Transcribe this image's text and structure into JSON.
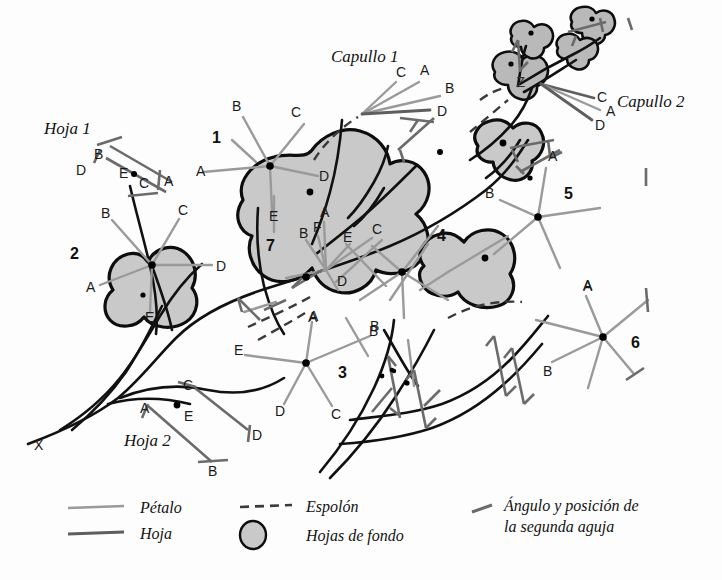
{
  "figure": {
    "title_labels": {
      "capullo1": "Capullo 1",
      "capullo2": "Capullo 2",
      "hoja1": "Hoja 1",
      "hoja2": "Hoja 2",
      "origin_marker": "X",
      "z_marker": "Z"
    },
    "background_color": "#fdfdfd",
    "colors": {
      "petal_line": "#9a9a9a",
      "leaf_line": "#5e5e5e",
      "outline": "#0d0d0d",
      "blob_fill": "#c9c9c9",
      "spur_dash": "#3a3a3a",
      "needle": "#6b6b6b"
    }
  },
  "clusters": [
    {
      "id": "1",
      "number": "1",
      "number_pos": [
        216,
        137
      ],
      "center": [
        270,
        166
      ],
      "petals": [
        {
          "label": "B",
          "label_pos": [
            235,
            107
          ],
          "tip": [
            245,
            119
          ]
        },
        {
          "label": "C",
          "label_pos": [
            294,
            113
          ],
          "tip": [
            305,
            124
          ]
        },
        {
          "label": "A",
          "label_pos": [
            200,
            171
          ],
          "tip": [
            212,
            170
          ]
        },
        {
          "label": "D",
          "label_pos": [
            322,
            176
          ],
          "tip": [
            312,
            174
          ]
        },
        {
          "label": "E",
          "label_pos": [
            273,
            216
          ],
          "tip": [
            272,
            205
          ]
        }
      ]
    },
    {
      "id": "2",
      "number": "2",
      "number_pos": [
        74,
        253
      ],
      "center": [
        152,
        265
      ],
      "petals": [
        {
          "label": "B",
          "label_pos": [
            105,
            213
          ],
          "tip": [
            116,
            223
          ]
        },
        {
          "label": "C",
          "label_pos": [
            181,
            210
          ],
          "tip": [
            176,
            222
          ]
        },
        {
          "label": "A",
          "label_pos": [
            90,
            287
          ],
          "tip": [
            104,
            284
          ]
        },
        {
          "label": "D",
          "label_pos": [
            220,
            266
          ],
          "tip": [
            208,
            265
          ]
        },
        {
          "label": "E",
          "label_pos": [
            149,
            316
          ],
          "tip": [
            150,
            305
          ]
        }
      ]
    },
    {
      "id": "3",
      "number": "3",
      "number_pos": [
        341,
        372
      ],
      "center": [
        306,
        363
      ],
      "petals": [
        {
          "label": "E",
          "label_pos": [
            237,
            350
          ],
          "tip": [
            250,
            356
          ]
        },
        {
          "label": "A",
          "label_pos": [
            313,
            317
          ],
          "tip": [
            312,
            330
          ]
        },
        {
          "label": "B",
          "label_pos": [
            372,
            331
          ],
          "tip": [
            366,
            342
          ]
        },
        {
          "label": "C",
          "label_pos": [
            334,
            414
          ],
          "tip": [
            330,
            400
          ]
        },
        {
          "label": "D",
          "label_pos": [
            278,
            411
          ],
          "tip": [
            287,
            398
          ]
        }
      ]
    },
    {
      "id": "4",
      "number": "4",
      "number_pos": [
        441,
        235
      ],
      "center": [
        402,
        272
      ],
      "petals": []
    },
    {
      "id": "5",
      "number": "5",
      "number_pos": [
        568,
        193
      ],
      "center": [
        538,
        217
      ],
      "petals": [
        {
          "label": "A",
          "label_pos": [
            551,
            156
          ],
          "tip": [
            549,
            168
          ]
        },
        {
          "label": "B",
          "label_pos": [
            488,
            193
          ],
          "tip": [
            500,
            200
          ]
        }
      ]
    },
    {
      "id": "6",
      "number": "6",
      "number_pos": [
        635,
        342
      ],
      "center": [
        603,
        337
      ],
      "petals": [
        {
          "label": "A",
          "label_pos": [
            586,
            285
          ],
          "tip": [
            587,
            298
          ]
        },
        {
          "label": "B",
          "label_pos": [
            546,
            370
          ],
          "tip": [
            557,
            362
          ]
        }
      ]
    },
    {
      "id": "7",
      "number": "7",
      "number_pos": [
        271,
        245
      ],
      "center": [
        326,
        270
      ],
      "petals": [
        {
          "label": "A",
          "label_pos": [
            325,
            211
          ],
          "tip": [
            325,
            222
          ]
        },
        {
          "label": "B",
          "label_pos": [
            303,
            231
          ],
          "tip": [
            310,
            240
          ]
        },
        {
          "label": "F",
          "label_pos": [
            317,
            225
          ],
          "tip": [
            320,
            236
          ]
        },
        {
          "label": "C",
          "label_pos": [
            376,
            228
          ],
          "tip": [
            370,
            238
          ]
        },
        {
          "label": "D",
          "label_pos": [
            341,
            281
          ],
          "tip": [
            338,
            272
          ]
        },
        {
          "label": "E",
          "label_pos": [
            347,
            236
          ],
          "tip": [
            348,
            246
          ]
        }
      ]
    }
  ],
  "capullo1": {
    "label": "Capullo 1",
    "label_pos": [
      331,
      58
    ],
    "hub": [
      362,
      114
    ],
    "rays": [
      {
        "label": "C",
        "label_pos": [
          400,
          72
        ],
        "tip": [
          398,
          84
        ]
      },
      {
        "label": "A",
        "label_pos": [
          424,
          70
        ],
        "tip": [
          420,
          83
        ]
      },
      {
        "label": "B",
        "label_pos": [
          449,
          88
        ],
        "tip": [
          440,
          96
        ]
      },
      {
        "label": "D",
        "label_pos": [
          442,
          112
        ],
        "tip": [
          430,
          111
        ]
      }
    ]
  },
  "capullo2": {
    "label": "Capullo 2",
    "label_pos": [
      620,
      102
    ],
    "hub": [
      541,
      84
    ],
    "rays": [
      {
        "label": "C",
        "label_pos": [
          600,
          97
        ],
        "tip": [
          592,
          99
        ]
      },
      {
        "label": "A",
        "label_pos": [
          608,
          112
        ],
        "tip": [
          598,
          110
        ]
      },
      {
        "label": "D",
        "label_pos": [
          599,
          125
        ],
        "tip": [
          591,
          120
        ]
      }
    ]
  },
  "hoja1": {
    "label": "Hoja 1",
    "label_pos": [
      44,
      130
    ],
    "center_dot": [
      134,
      174
    ],
    "markers": [
      {
        "label": "B",
        "label_pos": [
          97,
          153
        ]
      },
      {
        "label": "D",
        "label_pos": [
          79,
          170
        ]
      },
      {
        "label": "E",
        "label_pos": [
          123,
          174
        ]
      },
      {
        "label": "C",
        "label_pos": [
          142,
          182
        ]
      },
      {
        "label": "A",
        "label_pos": [
          166,
          181
        ]
      }
    ]
  },
  "hoja2": {
    "label": "Hoja 2",
    "label_pos": [
      126,
      440
    ],
    "center_dot": [
      177,
      405
    ],
    "markers": [
      {
        "label": "C",
        "label_pos": [
          185,
          385
        ]
      },
      {
        "label": "A",
        "label_pos": [
          145,
          408
        ]
      },
      {
        "label": "E",
        "label_pos": [
          188,
          415
        ]
      },
      {
        "label": "D",
        "label_pos": [
          256,
          435
        ]
      },
      {
        "label": "B",
        "label_pos": [
          212,
          470
        ]
      }
    ]
  },
  "legend": {
    "items": [
      {
        "key": "petalo",
        "label": "Pétalo",
        "swatch": "solid-light-line"
      },
      {
        "key": "hoja",
        "label": "Hoja",
        "swatch": "solid-dark-line"
      },
      {
        "key": "espolon",
        "label": "Espolón",
        "swatch": "dashed-line"
      },
      {
        "key": "fondo",
        "label": "Hojas de fondo",
        "swatch": "filled-circle"
      },
      {
        "key": "aguja",
        "label_line1": "Ángulo y posición de",
        "label_line2": "la segunda aguja",
        "swatch": "short-needle-tick"
      }
    ]
  }
}
